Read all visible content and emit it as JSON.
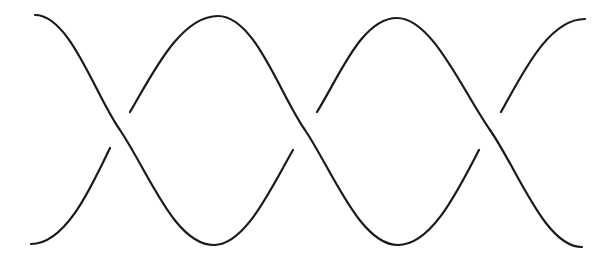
{
  "diagram": {
    "type": "braid",
    "stroke_color": "#1a1a1a",
    "background": "#ffffff",
    "stroke_width": 2.2,
    "strand_count": 2,
    "crossing_count": 3,
    "crossings": [
      {
        "x": 120,
        "y": 130,
        "over": "down-right"
      },
      {
        "x": 305,
        "y": 130,
        "over": "down-right"
      },
      {
        "x": 490,
        "y": 130,
        "over": "down-right"
      }
    ],
    "endpoints": {
      "top_left": [
        35,
        15
      ],
      "bottom_left": [
        31,
        244
      ],
      "top_right": [
        585,
        19
      ],
      "bottom_right": [
        582,
        247
      ]
    }
  }
}
